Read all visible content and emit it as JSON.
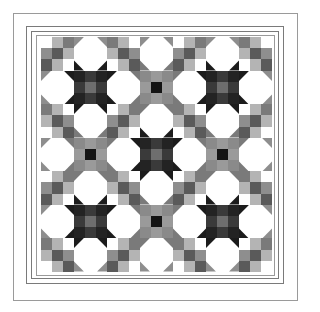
{
  "grid": {
    "rows": 7,
    "cols": 7
  },
  "colors": {
    "white": "#ffffff",
    "light": "#b4b4b4",
    "mid": "#8e8e8e",
    "gray": "#7a7a7a",
    "dark": "#5a5a5a",
    "darker": "#3c3c3c",
    "black": "#1c1c1c",
    "star_dark_corner": "#232323",
    "star_dark_edge": "#3a3a3a",
    "star_dark_center": "#6e6e6e",
    "star_light_sq": "#8a8a8a",
    "star_light_edge": "#9a9a9a",
    "star_light_center": "#141414",
    "border_line": "#7a7a7a"
  },
  "nine_patch": [
    [
      "white",
      "light",
      "gray"
    ],
    [
      "mid",
      "dark",
      "light"
    ],
    [
      "dark",
      "light",
      "white"
    ]
  ],
  "dark_star_blocks": [
    [
      1,
      1
    ],
    [
      1,
      5
    ],
    [
      3,
      3
    ],
    [
      5,
      1
    ],
    [
      5,
      5
    ]
  ],
  "light_star_blocks": [
    [
      1,
      3
    ],
    [
      3,
      1
    ],
    [
      3,
      5
    ],
    [
      5,
      3
    ]
  ]
}
